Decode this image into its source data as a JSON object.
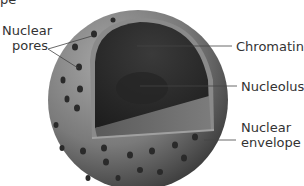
{
  "diagram": {
    "title_fragment": "pe",
    "labels": {
      "nuclear_pores": [
        "Nuclear",
        "pores"
      ],
      "chromatin": "Chromatin",
      "nucleolus": "Nucleolus",
      "nuclear_envelope": [
        "Nuclear",
        "envelope"
      ]
    },
    "colors": {
      "envelope_outer": "#6e6e6e",
      "envelope_light": "#9a9a9a",
      "interior_dark": "#2e2e2e",
      "cut_plane": "#6a6a6a",
      "pore": "#2a2a2a",
      "leader_line": "#444444",
      "text": "#333333"
    }
  }
}
